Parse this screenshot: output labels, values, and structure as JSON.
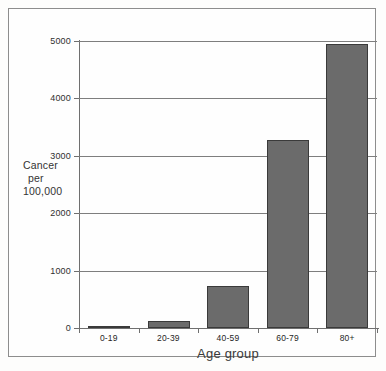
{
  "chart_data": {
    "type": "bar",
    "title": "",
    "subtitle": "",
    "xlabel": "Age group",
    "ylabel": "Cancer per 100,000",
    "ylabel_lines": [
      "Cancer",
      "per",
      "100,000"
    ],
    "categories": [
      "0-19",
      "20-39",
      "40-59",
      "60-79",
      "80+"
    ],
    "values": [
      25,
      125,
      730,
      3280,
      4950
    ],
    "series": [
      {
        "name": "Cancer incidence",
        "values": [
          25,
          125,
          730,
          3280,
          4950
        ]
      }
    ],
    "ylim": [
      0,
      5000
    ],
    "ytick_labels": [
      "0",
      "1000",
      "2000",
      "3000",
      "4000",
      "5000"
    ],
    "ytick_values": [
      0,
      1000,
      2000,
      3000,
      4000,
      5000
    ],
    "grid": true,
    "legend": "none",
    "bar_color": "#6b6b6b",
    "bar_border_color": "#3a3a3a",
    "grid_color": "#7e7e7e",
    "axis_color": "#6f6f6f",
    "background_color": "#fefefe",
    "frame_color": "#8d8d8d"
  }
}
